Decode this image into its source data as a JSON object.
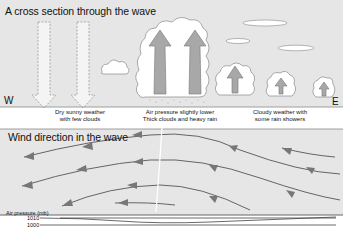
{
  "cross_section": {
    "title": "A cross section through the wave",
    "west_label": "W",
    "east_label": "E",
    "captions": [
      {
        "line1": "Dry sunny weather",
        "line2": "with few clouds"
      },
      {
        "line1": "Air pressure slightly lower",
        "line2": "Thick clouds and heavy rain"
      },
      {
        "line1": "Cloudy weather with",
        "line2": "some rain showers"
      }
    ]
  },
  "wind": {
    "title": "Wind direction in the wave"
  },
  "pressure": {
    "title": "Air pressure (mb)",
    "levels": [
      "1010",
      "1000"
    ]
  },
  "colors": {
    "panel_bg": "#e6e6e6",
    "arrow_fill": "#a8a8a8",
    "cloud_fill": "#ffffff",
    "line": "#555555"
  }
}
